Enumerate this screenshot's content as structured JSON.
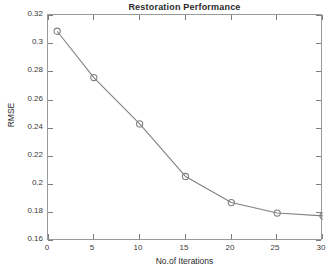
{
  "chart_data": {
    "type": "line",
    "title": "Restoration Performance",
    "xlabel": "No.of Iterations",
    "ylabel": "RMSE",
    "x": [
      1,
      5,
      10,
      15,
      20,
      25,
      30
    ],
    "values": [
      0.3085,
      0.2757,
      0.2429,
      0.2057,
      0.1872,
      0.1798,
      0.1778
    ],
    "series": [
      {
        "name": "RMSE",
        "x": [
          1,
          5,
          10,
          15,
          20,
          25,
          30
        ],
        "values": [
          0.3085,
          0.2757,
          0.2429,
          0.2057,
          0.1872,
          0.1798,
          0.1778
        ]
      }
    ],
    "xlim": [
      0,
      30
    ],
    "ylim": [
      0.16,
      0.32
    ],
    "xticks": [
      0,
      5,
      10,
      15,
      20,
      25,
      30
    ],
    "xtick_labels": [
      "0",
      "5",
      "10",
      "15",
      "20",
      "25",
      "30"
    ],
    "yticks": [
      0.16,
      0.18,
      0.2,
      0.22,
      0.24,
      0.26,
      0.28,
      0.3,
      0.32
    ],
    "ytick_labels": [
      "0.16",
      "0.18",
      "0.2",
      "0.22",
      "0.24",
      "0.26",
      "0.28",
      "0.3",
      "0.32"
    ],
    "grid": false,
    "legend": null,
    "marker": "circle-open",
    "line_color": "#808080",
    "marker_color": "#808080",
    "axis_color": "#9a9a9a",
    "background_color": "#ffffff",
    "text_color": "#2b2b2b"
  }
}
